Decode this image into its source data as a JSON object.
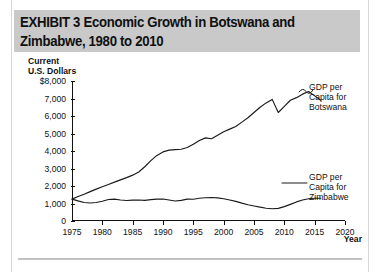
{
  "banner": {
    "title": "EXHIBIT 3  Economic Growth in Botswana and\nZimbabwe, 1980 to 2010",
    "background_color": "#c9c9c9"
  },
  "chart_data": {
    "type": "line",
    "title": "EXHIBIT 3  Economic Growth in Botswana and Zimbabwe, 1980 to 2010",
    "xlabel": "Year",
    "ylabel": "Current\nU.S. Dollars",
    "ylabel_lines": [
      "Current",
      "U.S. Dollars"
    ],
    "xlim": [
      1975,
      2020
    ],
    "ylim": [
      0,
      8000
    ],
    "grid": false,
    "legend_position": "inline-callouts",
    "x_ticks": [
      1975,
      1980,
      1985,
      1990,
      1995,
      2000,
      2005,
      2010,
      2015,
      2020
    ],
    "x_tick_labels": [
      "1975",
      "1980",
      "1985",
      "1990",
      "1995",
      "2000",
      "2005",
      "2010",
      "2015",
      "2020"
    ],
    "y_ticks": [
      0,
      1000,
      2000,
      3000,
      4000,
      5000,
      6000,
      7000,
      8000
    ],
    "y_tick_labels": [
      "0",
      "1,000",
      "2,000",
      "3,000",
      "4,000",
      "5,000",
      "6,000",
      "7,000",
      "$8,000"
    ],
    "line_color": "#1a1a1a",
    "x": [
      1975,
      1976,
      1977,
      1978,
      1979,
      1980,
      1981,
      1982,
      1983,
      1984,
      1985,
      1986,
      1987,
      1988,
      1989,
      1990,
      1991,
      1992,
      1993,
      1994,
      1995,
      1996,
      1997,
      1998,
      1999,
      2000,
      2001,
      2002,
      2003,
      2004,
      2005,
      2006,
      2007,
      2008,
      2009,
      2010,
      2011,
      2012,
      2013,
      2014,
      2015,
      2016
    ],
    "series": [
      {
        "name": "GDP per Capita for Botswana",
        "label_lines": [
          "GDP per",
          "Capita for",
          "Botswana"
        ],
        "values": [
          1250,
          1400,
          1530,
          1680,
          1820,
          1960,
          2090,
          2220,
          2350,
          2480,
          2620,
          2800,
          3100,
          3450,
          3750,
          3950,
          4050,
          4080,
          4100,
          4200,
          4380,
          4600,
          4750,
          4700,
          4900,
          5100,
          5250,
          5400,
          5650,
          5900,
          6200,
          6500,
          6750,
          6950,
          6200,
          6550,
          6900,
          7050,
          7250,
          7400,
          7150,
          6900
        ]
      },
      {
        "name": "GDP per Capita for Zimbabwe",
        "label_lines": [
          "GDP per",
          "Capita for",
          "Zimbabwe"
        ],
        "values": [
          1250,
          1150,
          1060,
          1030,
          1060,
          1130,
          1230,
          1250,
          1200,
          1170,
          1190,
          1200,
          1180,
          1220,
          1250,
          1260,
          1200,
          1140,
          1180,
          1250,
          1240,
          1300,
          1330,
          1340,
          1320,
          1270,
          1200,
          1120,
          1020,
          930,
          860,
          790,
          730,
          700,
          720,
          820,
          950,
          1090,
          1200,
          1270,
          1300,
          1300
        ]
      }
    ]
  },
  "callouts": {
    "botswana": "GDP per\nCapita for\nBotswana",
    "zimbabwe": "GDP per\nCapita for\nZimbabwe"
  },
  "axis_titles": {
    "y": "Current\nU.S. Dollars",
    "x": "Year"
  }
}
